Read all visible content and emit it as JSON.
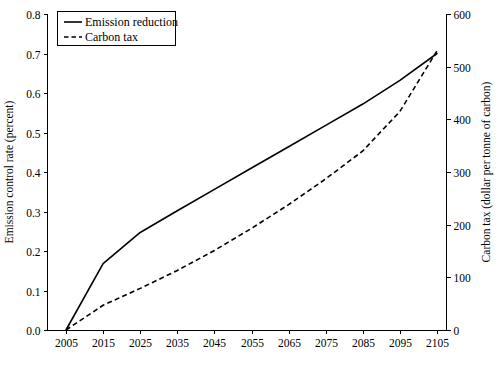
{
  "chart_data": {
    "type": "line",
    "title": "",
    "xlabel": "",
    "ylabel": "Emission control rate (percent)",
    "y2label": "Carbon tax (dollar per tonne of carbon)",
    "grid": false,
    "legend_position": "top-left",
    "xlim": [
      2005,
      2105
    ],
    "ylim": [
      0.0,
      0.8
    ],
    "y2lim": [
      0,
      600
    ],
    "x": [
      2005,
      2015,
      2025,
      2035,
      2045,
      2055,
      2065,
      2075,
      2085,
      2095,
      2105
    ],
    "xticks": [
      "2005",
      "2015",
      "2025",
      "2035",
      "2045",
      "2055",
      "2065",
      "2075",
      "2085",
      "2095",
      "2105"
    ],
    "yticks": [
      "0.0",
      "0.1",
      "0.2",
      "0.3",
      "0.4",
      "0.5",
      "0.6",
      "0.7",
      "0.8"
    ],
    "ytick_values": [
      0.0,
      0.1,
      0.2,
      0.3,
      0.4,
      0.5,
      0.6,
      0.7,
      0.8
    ],
    "y2ticks": [
      "0",
      "100",
      "200",
      "300",
      "400",
      "500",
      "600"
    ],
    "y2tick_values": [
      0,
      100,
      200,
      300,
      400,
      500,
      600
    ],
    "series": [
      {
        "name": "Emission reduction",
        "axis": "left",
        "style": "solid",
        "color": "#000000",
        "values": [
          0.0,
          0.168,
          0.247,
          0.302,
          0.356,
          0.41,
          0.464,
          0.518,
          0.572,
          0.632,
          0.7
        ]
      },
      {
        "name": "Carbon tax",
        "axis": "right",
        "style": "dashed",
        "color": "#000000",
        "values": [
          0,
          47,
          79,
          113,
          151,
          193,
          238,
          287,
          340,
          415,
          530
        ]
      }
    ]
  },
  "legend": {
    "items": [
      {
        "label": "Emission reduction",
        "style": "solid"
      },
      {
        "label": "Carbon tax",
        "style": "dashed"
      }
    ]
  }
}
